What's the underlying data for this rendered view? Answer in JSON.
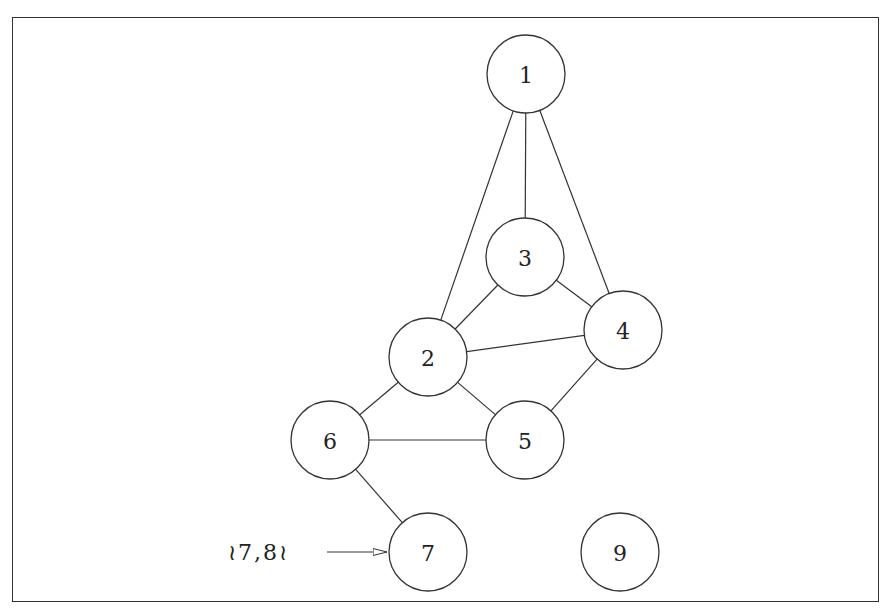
{
  "diagram": {
    "type": "undirected-graph",
    "nodes": [
      {
        "id": "1",
        "label": "1",
        "x": 526,
        "y": 74
      },
      {
        "id": "2",
        "label": "2",
        "x": 428,
        "y": 357
      },
      {
        "id": "3",
        "label": "3",
        "x": 525,
        "y": 257
      },
      {
        "id": "4",
        "label": "4",
        "x": 623,
        "y": 330
      },
      {
        "id": "5",
        "label": "5",
        "x": 525,
        "y": 440
      },
      {
        "id": "6",
        "label": "6",
        "x": 330,
        "y": 440
      },
      {
        "id": "7",
        "label": "7",
        "x": 428,
        "y": 552
      },
      {
        "id": "9",
        "label": "9",
        "x": 620,
        "y": 552
      }
    ],
    "node_radius": 39,
    "edges": [
      [
        "1",
        "2"
      ],
      [
        "1",
        "3"
      ],
      [
        "1",
        "4"
      ],
      [
        "2",
        "3"
      ],
      [
        "2",
        "4"
      ],
      [
        "3",
        "4"
      ],
      [
        "2",
        "5"
      ],
      [
        "2",
        "6"
      ],
      [
        "4",
        "5"
      ],
      [
        "6",
        "5"
      ],
      [
        "6",
        "7"
      ]
    ],
    "annotation": {
      "label": "≀7,8≀",
      "x": 228,
      "y": 552,
      "arrow_from": [
        327,
        552
      ],
      "arrow_to": [
        387,
        552
      ],
      "points_to": "7"
    },
    "colors": {
      "stroke": "#333333",
      "text": "#222222",
      "background": "#ffffff"
    }
  }
}
